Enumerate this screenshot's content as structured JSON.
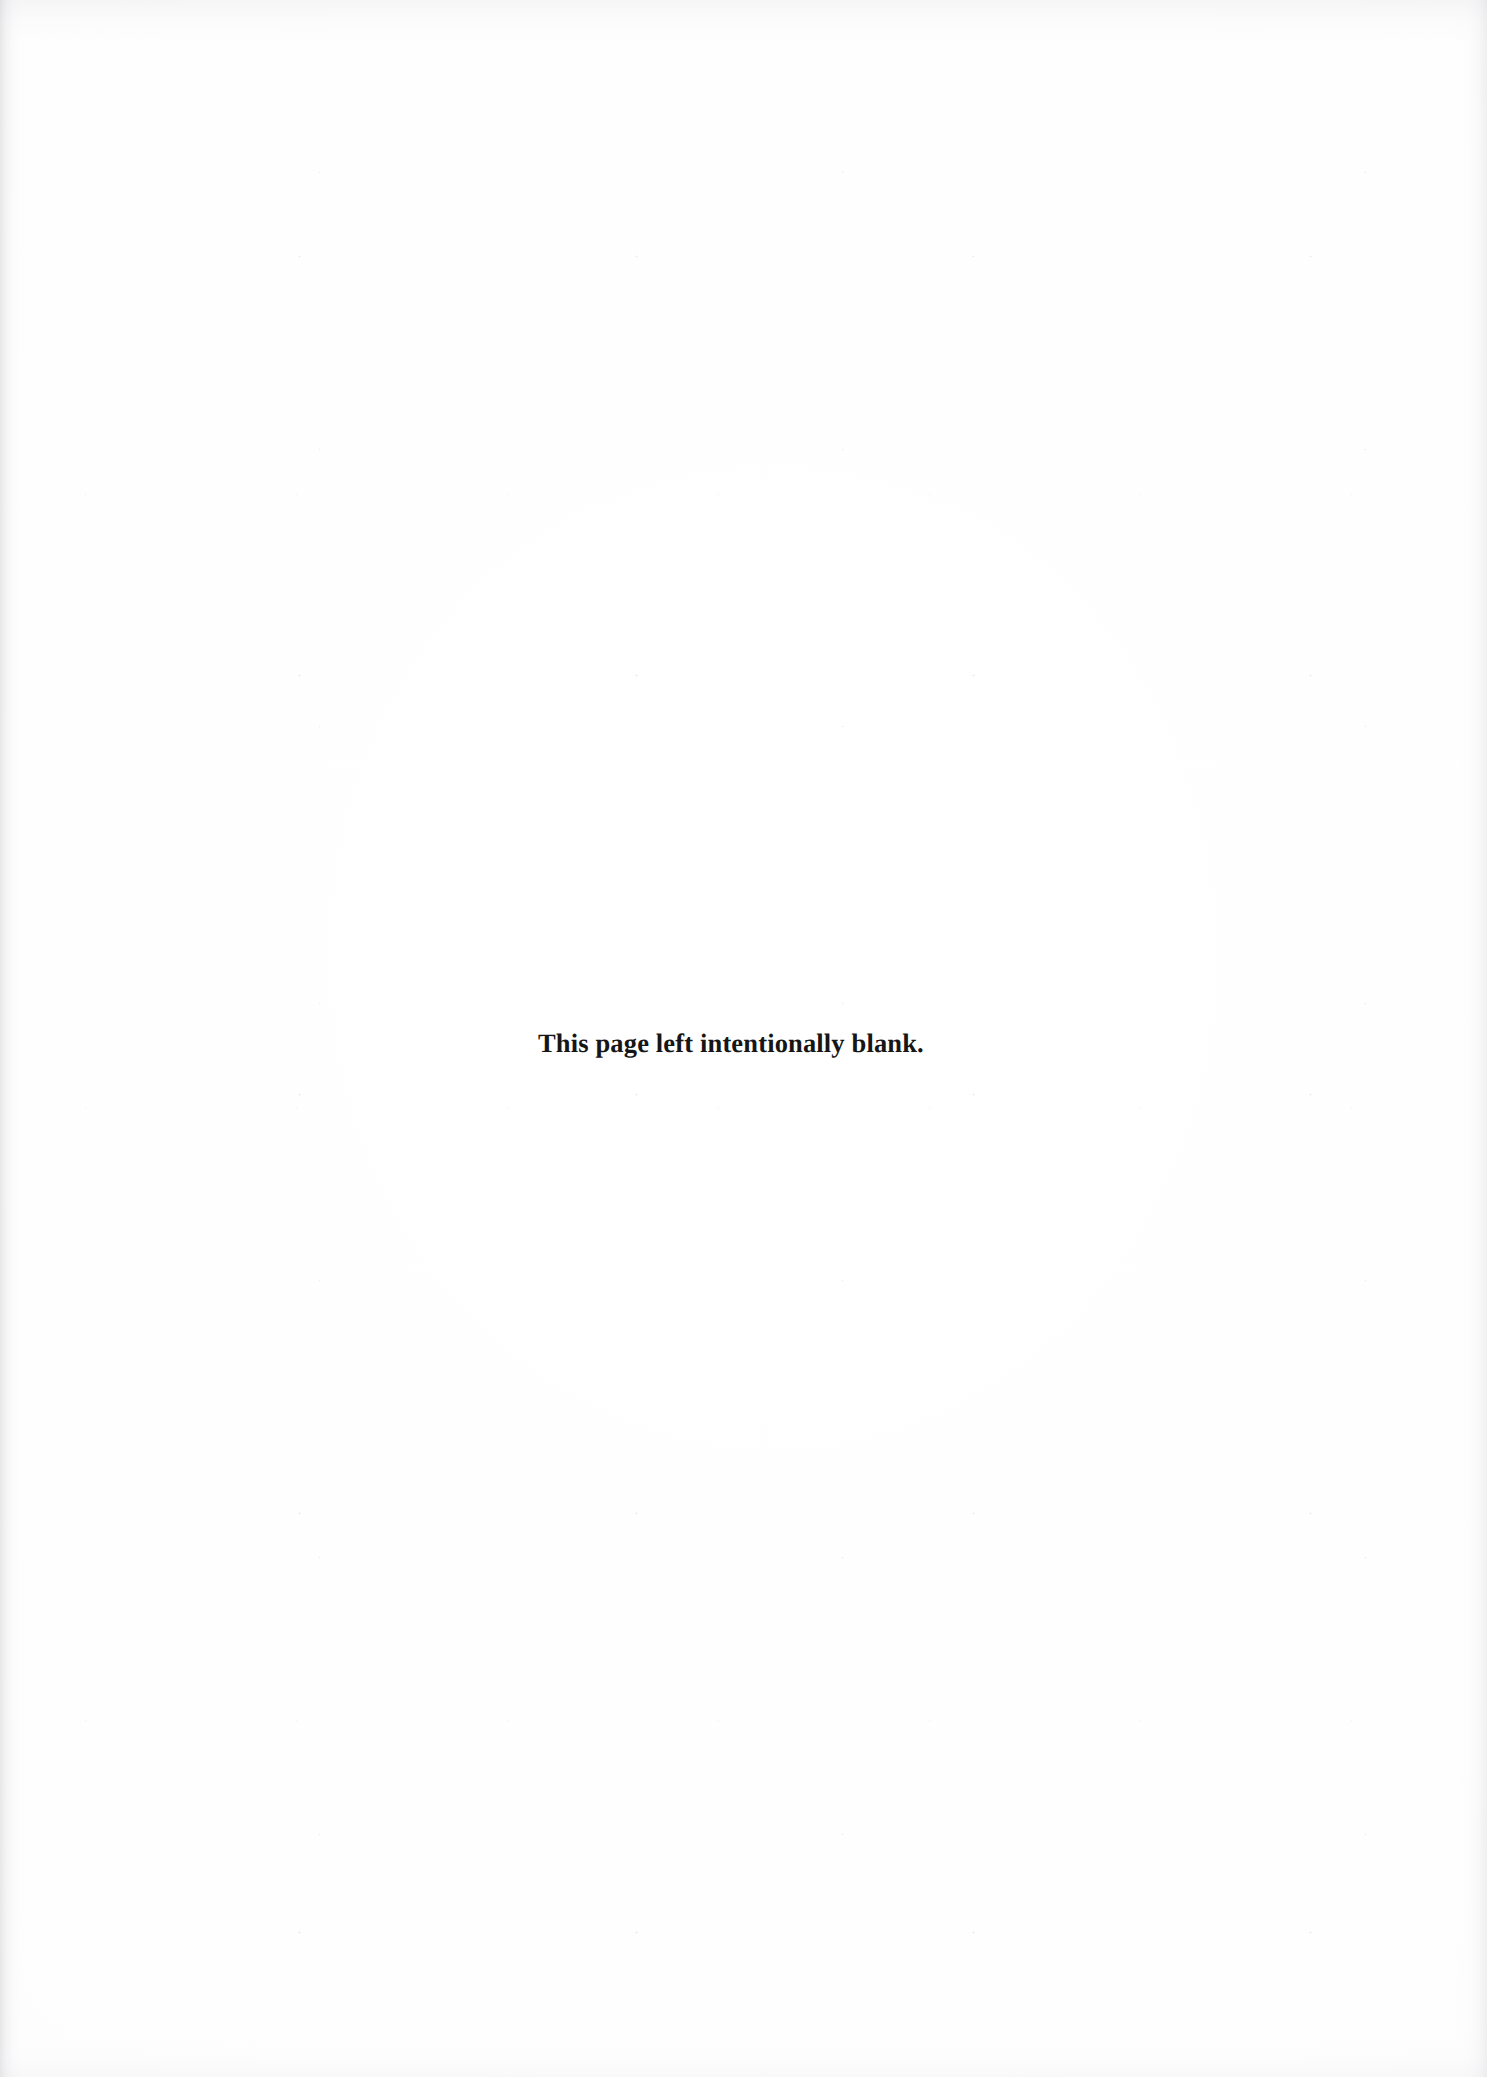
{
  "page": {
    "width": 1487,
    "height": 2077,
    "background_color": "#fefeff",
    "text_color": "#161616",
    "document_type": "scanned-book-page",
    "orientation": "portrait"
  },
  "content": {
    "notice": "This page left intentionally blank."
  },
  "artifacts": {
    "left_edge_shadow": "#c4c4c8",
    "right_edge_shadow": "#cdcdd1",
    "top_edge_noise": "#d6d6da",
    "bottom_edge_noise": "#dedee2",
    "speckle_color": "#aaaab2"
  }
}
